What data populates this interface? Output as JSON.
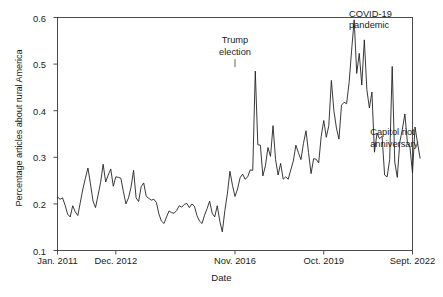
{
  "chart_data": {
    "type": "line",
    "title": "",
    "xlabel": "Date",
    "ylabel": "Percentage articles about rural America",
    "xlim": [
      "Jan. 2011",
      "Sept. 2022"
    ],
    "ylim": [
      0.1,
      0.6
    ],
    "grid": false,
    "legend": false,
    "y_ticks": [
      "0.1",
      "0.2",
      "0.3",
      "0.4",
      "0.5",
      "0.6"
    ],
    "y_tick_values": [
      0.1,
      0.2,
      0.3,
      0.4,
      0.5,
      0.6
    ],
    "x_ticks": [
      "Jan. 2011",
      "Dec. 2012",
      "Nov. 2016",
      "Oct. 2019",
      "Sept. 2022"
    ],
    "x_tick_positions": [
      0,
      23,
      70,
      105,
      140
    ],
    "line_color": "#222222",
    "line_width": 0.9,
    "series": [
      {
        "name": "Percentage articles about rural America",
        "x_start": "Jan. 2011",
        "x_step_months": 1,
        "n_points": 141,
        "values": [
          0.215,
          0.21,
          0.213,
          0.197,
          0.178,
          0.172,
          0.196,
          0.183,
          0.175,
          0.203,
          0.232,
          0.255,
          0.277,
          0.243,
          0.206,
          0.192,
          0.219,
          0.246,
          0.285,
          0.247,
          0.262,
          0.275,
          0.238,
          0.258,
          0.257,
          0.255,
          0.226,
          0.2,
          0.213,
          0.236,
          0.272,
          0.213,
          0.205,
          0.237,
          0.245,
          0.216,
          0.212,
          0.208,
          0.21,
          0.203,
          0.178,
          0.163,
          0.158,
          0.172,
          0.185,
          0.181,
          0.18,
          0.186,
          0.196,
          0.193,
          0.199,
          0.201,
          0.192,
          0.2,
          0.195,
          0.175,
          0.163,
          0.158,
          0.176,
          0.19,
          0.206,
          0.18,
          0.172,
          0.196,
          0.163,
          0.14,
          0.186,
          0.222,
          0.27,
          0.24,
          0.216,
          0.232,
          0.256,
          0.264,
          0.253,
          0.258,
          0.273,
          0.272,
          0.485,
          0.327,
          0.326,
          0.26,
          0.282,
          0.321,
          0.302,
          0.368,
          0.295,
          0.262,
          0.287,
          0.253,
          0.258,
          0.253,
          0.273,
          0.292,
          0.326,
          0.31,
          0.295,
          0.33,
          0.357,
          0.31,
          0.265,
          0.297,
          0.296,
          0.288,
          0.345,
          0.379,
          0.343,
          0.368,
          0.465,
          0.4,
          0.363,
          0.339,
          0.412,
          0.418,
          0.415,
          0.46,
          0.53,
          0.595,
          0.48,
          0.523,
          0.455,
          0.552,
          0.445,
          0.406,
          0.44,
          0.311,
          0.352,
          0.34,
          0.345,
          0.262,
          0.258,
          0.295,
          0.495,
          0.29,
          0.257,
          0.333,
          0.36,
          0.393,
          0.331,
          0.322,
          0.266,
          0.365,
          0.33,
          0.298
        ]
      }
    ],
    "annotations": [
      {
        "id": "trump-election",
        "text_line1": "Trump",
        "text_line2": "election",
        "x_index": 70,
        "y_value": 0.485
      },
      {
        "id": "covid-19-pandemic",
        "text_line1": "COVID-19",
        "text_line2": "pandemic",
        "x_index": 111,
        "y_value": 0.595
      },
      {
        "id": "capitol-riot-anniversary",
        "text_line1": "Capitol riot",
        "text_line2": "anniversary",
        "x_index": 132,
        "y_value": 0.495
      }
    ]
  },
  "axes": {
    "ylabel": "Percentage articles about rural America",
    "xlabel": "Date",
    "y_tick_labels": [
      "0.6",
      "0.5",
      "0.4",
      "0.3",
      "0.2",
      "0.1"
    ],
    "x_tick_labels": [
      "Jan. 2011",
      "Dec. 2012",
      "Nov. 2016",
      "Oct. 2019",
      "Sept. 2022"
    ]
  },
  "annotations": {
    "trump": {
      "line1": "Trump",
      "line2": "election"
    },
    "covid": {
      "line1": "COVID-19",
      "line2": "pandemic"
    },
    "capitol": {
      "line1": "Capitol riot",
      "line2": "anniversary"
    }
  }
}
